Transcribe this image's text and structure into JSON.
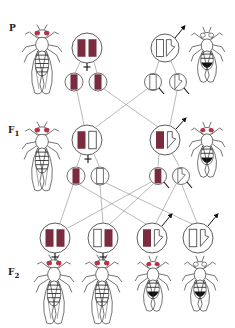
{
  "diagram": {
    "colors": {
      "red_allele": "#7a2b3e",
      "line": "#8a8a8a",
      "outline": "#333333",
      "eye_red": "#b8324a"
    },
    "generations": [
      {
        "id": "P",
        "label": "P",
        "label_sub": "",
        "female": {
          "genotype": [
            "X-red",
            "X-red"
          ],
          "phenotype": "red-eyed female"
        },
        "male": {
          "genotype": [
            "X-white",
            "Y"
          ],
          "phenotype": "white-eyed male"
        },
        "gametes_female": [
          "X-red",
          "X-red"
        ],
        "gametes_male": [
          "X-white",
          "Y"
        ]
      },
      {
        "id": "F1",
        "label": "F",
        "label_sub": "1",
        "female": {
          "genotype": [
            "X-red",
            "X-white"
          ],
          "phenotype": "red-eyed female"
        },
        "male": {
          "genotype": [
            "X-red",
            "Y"
          ],
          "phenotype": "red-eyed male"
        },
        "gametes_female": [
          "X-red",
          "X-white"
        ],
        "gametes_male": [
          "X-red",
          "Y"
        ]
      },
      {
        "id": "F2",
        "label": "F",
        "label_sub": "2",
        "offspring": [
          {
            "genotype": [
              "X-red",
              "X-red"
            ],
            "sex": "female",
            "phenotype": "red-eyed female"
          },
          {
            "genotype": [
              "X-white",
              "X-red"
            ],
            "sex": "female",
            "phenotype": "red-eyed female"
          },
          {
            "genotype": [
              "X-red",
              "Y"
            ],
            "sex": "male",
            "phenotype": "red-eyed male"
          },
          {
            "genotype": [
              "X-white",
              "Y"
            ],
            "sex": "male",
            "phenotype": "white-eyed male"
          }
        ]
      }
    ],
    "symbols": {
      "female": "female-symbol",
      "male": "male-symbol"
    }
  }
}
